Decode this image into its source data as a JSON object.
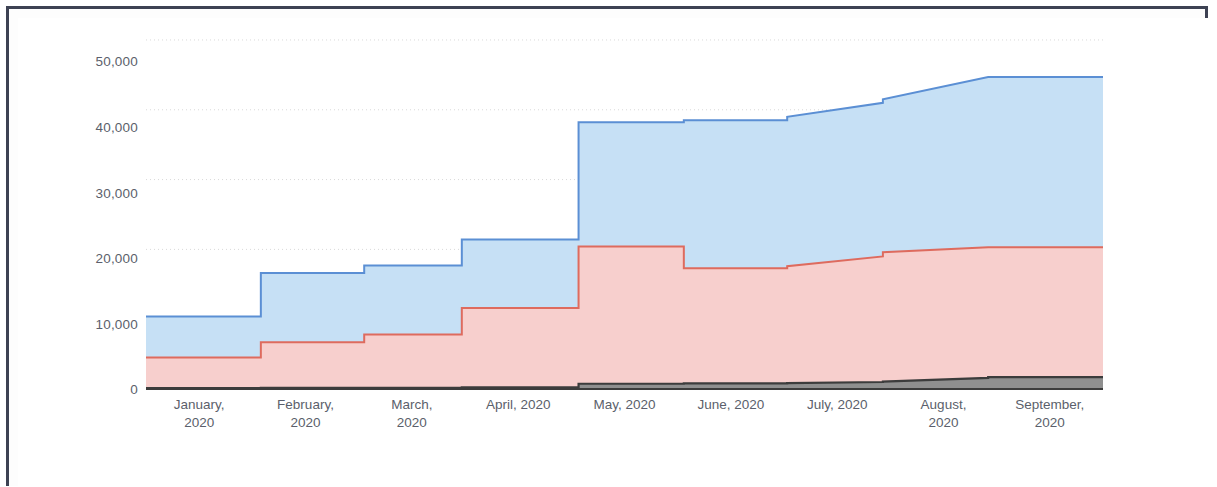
{
  "chart_data": {
    "type": "area",
    "subtype": "stacked-step-area",
    "title": "",
    "xlabel": "",
    "ylabel": "",
    "categories": [
      "January, 2020",
      "February, 2020",
      "March, 2020",
      "April, 2020",
      "May, 2020",
      "June, 2020",
      "July, 2020",
      "August, 2020",
      "September, 2020"
    ],
    "x_tick_labels": [
      [
        "January,",
        "2020"
      ],
      [
        "February,",
        "2020"
      ],
      [
        "March,",
        "2020"
      ],
      [
        "April, 2020"
      ],
      [
        "May, 2020"
      ],
      [
        "June, 2020"
      ],
      [
        "July, 2020"
      ],
      [
        "August,",
        "2020"
      ],
      [
        "September,",
        "2020"
      ]
    ],
    "y_tick_labels": [
      "50,000",
      "40,000",
      "30,000",
      "20,000",
      "10,000",
      "0"
    ],
    "y_tick_values": [
      50000,
      40000,
      30000,
      20000,
      10000,
      0
    ],
    "ylim": [
      0,
      52000
    ],
    "grid": "horizontal-dotted",
    "legend": "none",
    "steps": 18,
    "series": [
      {
        "name": "series-3-blue",
        "color": "#5b8fd4",
        "fill": "#c6e0f5",
        "stack_order": 3,
        "cumulative_values": [
          10400,
          10400,
          16600,
          16600,
          17700,
          17700,
          21400,
          21400,
          38200,
          38200,
          38500,
          38500,
          39000,
          41000,
          41500,
          44700,
          44700,
          44700
        ]
      },
      {
        "name": "series-2-red",
        "color": "#de6b5e",
        "fill": "#f7cfcd",
        "stack_order": 2,
        "cumulative_values": [
          4500,
          4500,
          6700,
          6700,
          7800,
          7800,
          11600,
          11600,
          20400,
          20400,
          17300,
          17300,
          17600,
          19000,
          19600,
          20300,
          20300,
          20300
        ]
      },
      {
        "name": "series-1-dark",
        "color": "#3c3c3c",
        "fill": "#8f8f8f",
        "stack_order": 1,
        "cumulative_values": [
          120,
          120,
          150,
          150,
          180,
          180,
          220,
          220,
          750,
          750,
          800,
          800,
          850,
          1000,
          1050,
          1600,
          1700,
          1700
        ]
      }
    ],
    "step_x_fractions": [
      0.0,
      0.12,
      0.12,
      0.228,
      0.228,
      0.33,
      0.33,
      0.452,
      0.452,
      0.562,
      0.562,
      0.67,
      0.67,
      0.77,
      0.77,
      0.88,
      0.88,
      1.0
    ]
  },
  "axes": {
    "y_ticks": [
      {
        "label": "50,000",
        "value": 50000
      },
      {
        "label": "40,000",
        "value": 40000
      },
      {
        "label": "30,000",
        "value": 30000
      },
      {
        "label": "20,000",
        "value": 20000
      },
      {
        "label": "10,000",
        "value": 10000
      },
      {
        "label": "0",
        "value": 0
      }
    ],
    "x_ticks": [
      {
        "line1": "January,",
        "line2": "2020"
      },
      {
        "line1": "February,",
        "line2": "2020"
      },
      {
        "line1": "March,",
        "line2": "2020"
      },
      {
        "line1": "April, 2020",
        "line2": ""
      },
      {
        "line1": "May, 2020",
        "line2": ""
      },
      {
        "line1": "June, 2020",
        "line2": ""
      },
      {
        "line1": "July, 2020",
        "line2": ""
      },
      {
        "line1": "August,",
        "line2": "2020"
      },
      {
        "line1": "September,",
        "line2": "2020"
      }
    ]
  },
  "colors": {
    "blue_stroke": "#5b8fd4",
    "blue_fill": "#c6e0f5",
    "red_stroke": "#de6b5e",
    "red_fill": "#f7cfcd",
    "dark_stroke": "#3c3c3c",
    "dark_fill": "#8f8f8f",
    "grid": "#d9d9d9",
    "axis_text": "#5b5f6b",
    "border": "#3d4253"
  }
}
